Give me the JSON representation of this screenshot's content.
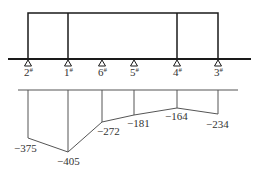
{
  "diagram": {
    "frame": {
      "top_y": 13,
      "ground_y": 59,
      "left_x": 28,
      "right_x": 218,
      "inner_columns_x": [
        68,
        177
      ]
    },
    "ground_line": {
      "x1": 8,
      "x2": 251,
      "y": 59
    },
    "supports": [
      {
        "id": "2#",
        "label": "2#",
        "x": 28
      },
      {
        "id": "1#",
        "label": "1#",
        "x": 68
      },
      {
        "id": "6#",
        "label": "6#",
        "x": 102
      },
      {
        "id": "5#",
        "label": "5#",
        "x": 134
      },
      {
        "id": "4#",
        "label": "4#",
        "x": 177
      },
      {
        "id": "3#",
        "label": "3#",
        "x": 218
      }
    ],
    "moment_diagram": {
      "baseline": {
        "x1": 18,
        "x2": 238,
        "y": 90
      },
      "values": [
        {
          "support": "2#",
          "x": 28,
          "y": 138,
          "value": "−375",
          "label_x": 14,
          "label_y": 152
        },
        {
          "support": "1#",
          "x": 68,
          "y": 152,
          "value": "−405",
          "label_x": 57,
          "label_y": 165
        },
        {
          "support": "6#",
          "x": 102,
          "y": 122,
          "value": "−272",
          "label_x": 97,
          "label_y": 135
        },
        {
          "support": "5#",
          "x": 134,
          "y": 115,
          "value": "−181",
          "label_x": 127,
          "label_y": 127
        },
        {
          "support": "4#",
          "x": 177,
          "y": 108,
          "value": "−164",
          "label_x": 165,
          "label_y": 120
        },
        {
          "support": "3#",
          "x": 218,
          "y": 114,
          "value": "−234",
          "label_x": 206,
          "label_y": 128
        }
      ]
    }
  },
  "colors": {
    "line": "#1a1a1a",
    "thin_line": "#555555",
    "text": "#333333"
  }
}
